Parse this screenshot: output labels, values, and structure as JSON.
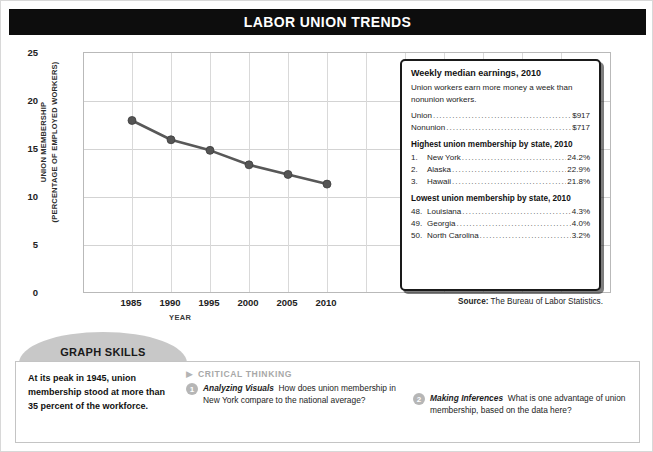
{
  "title": "LABOR UNION TRENDS",
  "chart_data": {
    "type": "line",
    "title": "LABOR UNION TRENDS",
    "xlabel": "YEAR",
    "ylabel": "UNION MEMBERSHIP (PERCENTAGE OF EMPLOYED WORKERS)",
    "ylabel_line1": "UNION MEMBERSHIP",
    "ylabel_line2": "(PERCENTAGE OF EMPLOYED WORKERS)",
    "categories": [
      "1985",
      "1990",
      "1995",
      "2000",
      "2005",
      "2010"
    ],
    "values": [
      18.0,
      16.0,
      14.9,
      13.4,
      12.4,
      11.4
    ],
    "x": [
      1985,
      1990,
      1995,
      2000,
      2005,
      2010
    ],
    "ylim": [
      0,
      25
    ],
    "yticks": [
      "25",
      "20",
      "15",
      "10",
      "5",
      "0"
    ],
    "ytick_values": [
      25,
      20,
      15,
      10,
      5,
      0
    ],
    "xticks": [
      "1985",
      "1990",
      "1995",
      "2000",
      "2005",
      "2010"
    ],
    "grid": true,
    "legend": "none",
    "series_color": "#585858",
    "marker_color": "#555555"
  },
  "info_box": {
    "earnings_heading": "Weekly median earnings, 2010",
    "earnings_note": "Union workers earn more money a week than nonunion workers.",
    "earnings_rows": [
      {
        "label": "Union",
        "value": "$917"
      },
      {
        "label": "Nonunion",
        "value": "$717"
      }
    ],
    "highest_heading": "Highest union membership by state, 2010",
    "highest_rows": [
      {
        "rank": "1.",
        "state": "New York",
        "value": "24.2%"
      },
      {
        "rank": "2.",
        "state": "Alaska",
        "value": "22.9%"
      },
      {
        "rank": "3.",
        "state": "Hawaii",
        "value": "21.8%"
      }
    ],
    "lowest_heading": "Lowest union membership by state, 2010",
    "lowest_rows": [
      {
        "rank": "48.",
        "state": "Louisiana",
        "value": "4.3%"
      },
      {
        "rank": "49.",
        "state": "Georgia",
        "value": "4.0%"
      },
      {
        "rank": "50.",
        "state": "North Carolina",
        "value": "3.2%"
      }
    ]
  },
  "source": {
    "label": "Source:",
    "text": "The Bureau of Labor Statistics."
  },
  "skills": {
    "tab_label": "GRAPH SKILLS",
    "fact": "At its peak in 1945, union membership stood at more than 35 percent of the workforce.",
    "critical_thinking_label": "CRITICAL THINKING",
    "questions": [
      {
        "number": "1",
        "lead": "Analyzing Visuals",
        "text": "How does union membership in New York compare to the national average?"
      },
      {
        "number": "2",
        "lead": "Making Inferences",
        "text": "What is one advantage of union membership, based on the data here?"
      }
    ]
  },
  "colors": {
    "banner": "#0d0d0d",
    "tab_gray": "#c8c8c8",
    "badge_gray": "#b6b6b6",
    "line": "#585858"
  }
}
